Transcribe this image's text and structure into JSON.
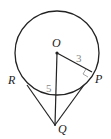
{
  "diagram": {
    "type": "geometry",
    "points": {
      "O": {
        "label": "O",
        "x": 57,
        "y": 53
      },
      "P": {
        "label": "P",
        "x": 92,
        "y": 72
      },
      "Q": {
        "label": "Q",
        "x": 55,
        "y": 125
      },
      "R": {
        "label": "R",
        "x": 25,
        "y": 82
      }
    },
    "circle": {
      "cx": 57,
      "cy": 53,
      "r": 42
    },
    "segments": [
      {
        "from": "O",
        "to": "P",
        "label": "3"
      },
      {
        "from": "O",
        "to": "Q",
        "label": "5"
      },
      {
        "from": "Q",
        "to": "P",
        "label": ""
      },
      {
        "from": "Q",
        "to": "R",
        "label": ""
      }
    ],
    "right_angle_at": "P",
    "labels": {
      "O": "O",
      "P": "P",
      "Q": "Q",
      "R": "R",
      "OP_length": "3",
      "OQ_length": "5"
    },
    "colors": {
      "stroke": "#222222",
      "number": "#888888"
    }
  }
}
